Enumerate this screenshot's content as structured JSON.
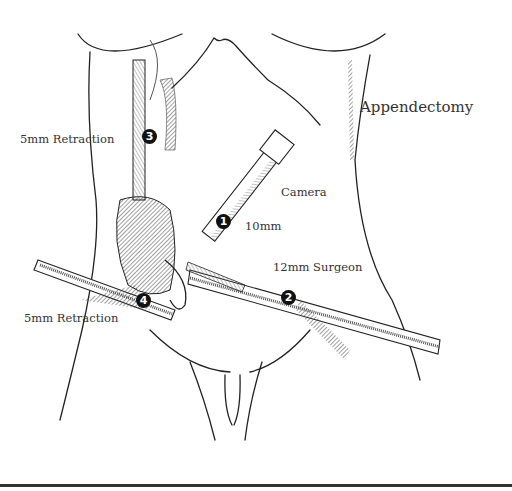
{
  "figure": {
    "title": "Appendectomy",
    "ports": [
      {
        "number": "1",
        "label_lines": [
          "Camera",
          "10mm"
        ]
      },
      {
        "number": "2",
        "label": "12mm Surgeon"
      },
      {
        "number": "3",
        "label": "5mm Retraction"
      },
      {
        "number": "4",
        "label": "5mm Retraction"
      }
    ],
    "colors": {
      "line": "#222222",
      "text": "#333333",
      "background": "#ffffff"
    }
  }
}
